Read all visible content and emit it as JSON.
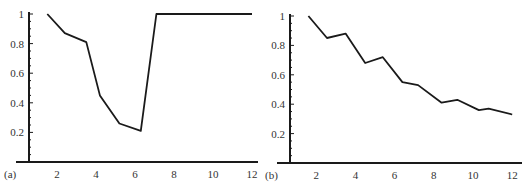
{
  "colors": {
    "line": "#1a1a1a",
    "axis": "#1a1a1a",
    "text": "#333333",
    "background": "#ffffff"
  },
  "chart_data": [
    {
      "type": "line",
      "panel_label": "(a)",
      "title": "",
      "xlabel": "",
      "ylabel": "",
      "xlim": [
        0.6,
        12.3
      ],
      "ylim": [
        0,
        1.0
      ],
      "xticks": [
        2,
        4,
        6,
        8,
        10,
        12
      ],
      "yticks": [
        0.2,
        0.4,
        0.6,
        0.8,
        1
      ],
      "ytick_labels": [
        "0.2",
        "0.4",
        "0.6",
        "0.8",
        "1"
      ],
      "xtick_labels": [
        "2",
        "4",
        "6",
        "8",
        "10",
        "12"
      ],
      "grid": false,
      "legend": null,
      "x": [
        1.5,
        2.4,
        3.5,
        4.2,
        5.2,
        6.3,
        7.1,
        12.0
      ],
      "y": [
        1.0,
        0.87,
        0.81,
        0.45,
        0.26,
        0.21,
        1.0,
        1.0
      ]
    },
    {
      "type": "line",
      "panel_label": "(b)",
      "title": "",
      "xlabel": "",
      "ylabel": "",
      "xlim": [
        0.6,
        12.3
      ],
      "ylim": [
        0,
        1.0
      ],
      "xticks": [
        2,
        4,
        6,
        8,
        10,
        12
      ],
      "yticks": [
        0.2,
        0.4,
        0.6,
        0.8,
        1
      ],
      "ytick_labels": [
        "0.2",
        "0.4",
        "0.6",
        "0.8",
        "1"
      ],
      "xtick_labels": [
        "2",
        "4",
        "6",
        "8",
        "10",
        "12"
      ],
      "grid": false,
      "legend": null,
      "x": [
        1.6,
        2.55,
        3.5,
        4.5,
        5.4,
        6.4,
        7.2,
        8.4,
        9.2,
        10.3,
        10.8,
        12.0
      ],
      "y": [
        1.0,
        0.85,
        0.88,
        0.68,
        0.72,
        0.55,
        0.53,
        0.41,
        0.43,
        0.36,
        0.37,
        0.33
      ]
    }
  ]
}
